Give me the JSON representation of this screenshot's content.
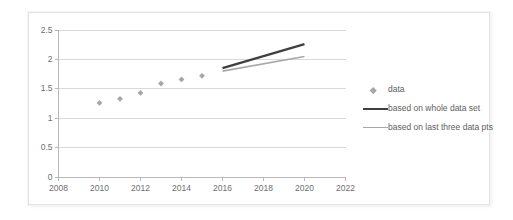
{
  "chart_data": {
    "type": "scatter",
    "title": "",
    "xlabel": "",
    "ylabel": "",
    "xlim": [
      2008,
      2022
    ],
    "ylim": [
      0,
      2.5
    ],
    "grid": true,
    "grid_axis": "y",
    "legend_position": "right",
    "x_ticks": [
      "2008",
      "2010",
      "2012",
      "2014",
      "2016",
      "2018",
      "2020",
      "2022"
    ],
    "x_tick_values": [
      2008,
      2010,
      2012,
      2014,
      2016,
      2018,
      2020,
      2022
    ],
    "y_ticks": [
      "0",
      "0.5",
      "1",
      "1.5",
      "2",
      "2.5"
    ],
    "y_tick_values": [
      0,
      0.5,
      1,
      1.5,
      2,
      2.5
    ],
    "series": [
      {
        "name": "data",
        "type": "scatter",
        "marker": "diamond",
        "color": "#a6a6a6",
        "x": [
          2010,
          2011,
          2012,
          2013,
          2014,
          2015
        ],
        "values": [
          1.26,
          1.33,
          1.43,
          1.59,
          1.66,
          1.72
        ]
      },
      {
        "name": "based on whole data set",
        "type": "line",
        "color": "#404040",
        "linewidth": 2.4,
        "x": [
          2016,
          2020
        ],
        "values": [
          1.85,
          2.26
        ]
      },
      {
        "name": "based on last three data pts",
        "type": "line",
        "color": "#a8a8a8",
        "linewidth": 1.6,
        "x": [
          2016,
          2020
        ],
        "values": [
          1.8,
          2.05
        ]
      }
    ]
  },
  "legend": {
    "entries": [
      {
        "label": "data",
        "swatch": "diamond-marker"
      },
      {
        "label": "based on whole data set",
        "swatch": "dark-line"
      },
      {
        "label": "based on last three data pts",
        "swatch": "gray-line"
      }
    ]
  },
  "colors": {
    "marker": "#a6a6a6",
    "line_whole": "#404040",
    "line_last_three": "#a8a8a8",
    "axis": "#b8b8b8",
    "gridline": "#d9d9d9",
    "tick_text": "#6f6f6f",
    "legend_text": "#5e5e5e",
    "frame": "#e3e3e3",
    "background": "#ffffff"
  }
}
